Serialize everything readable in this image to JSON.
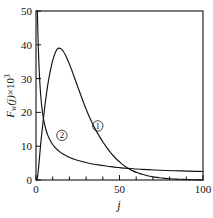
{
  "chart_data": {
    "type": "line",
    "title": "",
    "xlabel": "j",
    "ylabel": "Fw(j)×10³",
    "ylabel_parts": {
      "symbol": "F",
      "subscript": "w",
      "argument": "(j)",
      "operator": "×",
      "factor_base": "10",
      "factor_exponent": "3"
    },
    "xlim": [
      0,
      100
    ],
    "ylim": [
      0,
      50
    ],
    "x_ticks": [
      0,
      10,
      20,
      30,
      40,
      50,
      60,
      70,
      80,
      90,
      100
    ],
    "x_tick_labels": [
      "0",
      "",
      "",
      "",
      "",
      "50",
      "",
      "",
      "",
      "",
      "100"
    ],
    "y_ticks": [
      0,
      10,
      20,
      30,
      40,
      50
    ],
    "y_tick_labels": [
      "0",
      "10",
      "20",
      "30",
      "40",
      "50"
    ],
    "grid": false,
    "legend_position": "inline-annotations",
    "annotations": [
      {
        "text": "①",
        "label": "curve-1-tag",
        "x": 37,
        "y": 16
      },
      {
        "text": "②",
        "label": "curve-2-tag",
        "x": 15.5,
        "y": 13.2
      }
    ],
    "series": [
      {
        "name": "①",
        "label": "curve-1",
        "color": "#111111",
        "points": [
          [
            0.6,
            0.0
          ],
          [
            1.2,
            2.0
          ],
          [
            1.9,
            5.5
          ],
          [
            2.6,
            9.5
          ],
          [
            3.4,
            13.5
          ],
          [
            4.3,
            17.5
          ],
          [
            5.2,
            21.5
          ],
          [
            6.2,
            25.2
          ],
          [
            7.2,
            28.6
          ],
          [
            8.3,
            31.6
          ],
          [
            9.4,
            34.2
          ],
          [
            10.5,
            36.2
          ],
          [
            11.6,
            37.7
          ],
          [
            12.7,
            38.7
          ],
          [
            13.8,
            39.0
          ],
          [
            15.0,
            38.8
          ],
          [
            16.3,
            38.1
          ],
          [
            17.6,
            37.0
          ],
          [
            19.0,
            35.5
          ],
          [
            20.5,
            33.7
          ],
          [
            22.0,
            31.7
          ],
          [
            23.6,
            29.5
          ],
          [
            25.2,
            27.3
          ],
          [
            26.9,
            25.0
          ],
          [
            28.6,
            22.7
          ],
          [
            30.4,
            20.5
          ],
          [
            32.2,
            18.4
          ],
          [
            34.1,
            16.4
          ],
          [
            36.0,
            14.6
          ],
          [
            38.0,
            12.9
          ],
          [
            40.0,
            11.3
          ],
          [
            42.1,
            9.8
          ],
          [
            44.2,
            8.4
          ],
          [
            46.4,
            7.1
          ],
          [
            48.6,
            6.0
          ],
          [
            50.9,
            5.0
          ],
          [
            53.2,
            4.1
          ],
          [
            55.6,
            3.3
          ],
          [
            58.0,
            2.7
          ],
          [
            60.5,
            2.2
          ],
          [
            63.0,
            1.8
          ],
          [
            65.6,
            1.4
          ],
          [
            68.2,
            1.1
          ],
          [
            71.0,
            0.85
          ],
          [
            74.0,
            0.65
          ],
          [
            77.0,
            0.5
          ],
          [
            80.0,
            0.38
          ],
          [
            84.0,
            0.26
          ],
          [
            88.0,
            0.17
          ],
          [
            92.0,
            0.1
          ],
          [
            96.0,
            0.05
          ],
          [
            100.0,
            0.02
          ]
        ]
      },
      {
        "name": "②",
        "label": "curve-2",
        "color": "#111111",
        "points": [
          [
            0.8,
            50.0
          ],
          [
            1.1,
            44.0
          ],
          [
            1.5,
            37.5
          ],
          [
            2.0,
            31.5
          ],
          [
            2.6,
            26.5
          ],
          [
            3.3,
            22.5
          ],
          [
            4.1,
            19.3
          ],
          [
            5.0,
            16.8
          ],
          [
            6.0,
            14.8
          ],
          [
            7.1,
            13.2
          ],
          [
            8.3,
            11.9
          ],
          [
            9.6,
            10.8
          ],
          [
            11.0,
            9.9
          ],
          [
            12.5,
            9.1
          ],
          [
            14.1,
            8.4
          ],
          [
            15.8,
            7.8
          ],
          [
            17.6,
            7.3
          ],
          [
            19.5,
            6.8
          ],
          [
            21.5,
            6.4
          ],
          [
            23.6,
            6.0
          ],
          [
            25.8,
            5.7
          ],
          [
            28.1,
            5.4
          ],
          [
            30.5,
            5.1
          ],
          [
            33.0,
            4.8
          ],
          [
            35.6,
            4.6
          ],
          [
            38.3,
            4.4
          ],
          [
            41.1,
            4.2
          ],
          [
            44.0,
            4.0
          ],
          [
            47.0,
            3.8
          ],
          [
            50.1,
            3.65
          ],
          [
            53.3,
            3.5
          ],
          [
            56.6,
            3.4
          ],
          [
            60.0,
            3.25
          ],
          [
            63.5,
            3.15
          ],
          [
            67.1,
            3.05
          ],
          [
            70.8,
            2.95
          ],
          [
            74.6,
            2.88
          ],
          [
            78.5,
            2.8
          ],
          [
            82.5,
            2.73
          ],
          [
            86.6,
            2.68
          ],
          [
            90.8,
            2.62
          ],
          [
            95.1,
            2.57
          ],
          [
            100.0,
            2.52
          ]
        ]
      }
    ]
  },
  "plot_geometry": {
    "left": 36,
    "right": 203,
    "top": 11,
    "bottom": 180
  }
}
